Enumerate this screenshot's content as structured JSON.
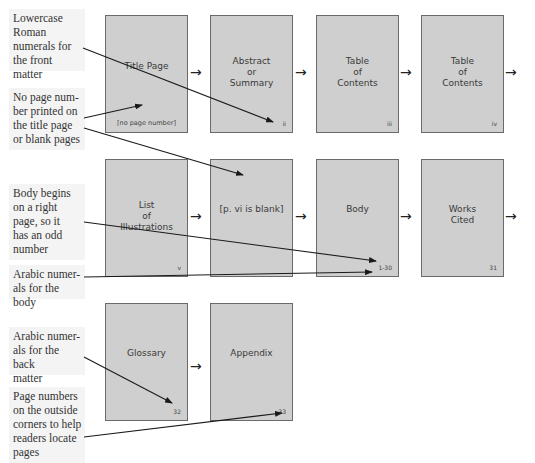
{
  "annotations": [
    {
      "id": "front-matter",
      "text": "Lowercase\nRoman\nnumerals for\nthe front matter"
    },
    {
      "id": "no-number",
      "text": "No page num-\nber printed on\nthe title page\nor blank pages"
    },
    {
      "id": "body-right",
      "text": "Body begins\non a right\npage, so it\nhas an odd\nnumber"
    },
    {
      "id": "arabic-body",
      "text": "Arabic numer-\nals for the body"
    },
    {
      "id": "arabic-back",
      "text": "Arabic numer-\nals for the back\nmatter"
    },
    {
      "id": "outside-corners",
      "text": "Page numbers\non the outside\ncorners to help\nreaders locate\npages"
    }
  ],
  "rows": [
    {
      "pages": [
        {
          "title": "Title Page",
          "number": "[no page number]"
        },
        {
          "title": "Abstract\nor\nSummary",
          "number": "ii"
        },
        {
          "title": "Table\nof\nContents",
          "number": "iii"
        },
        {
          "title": "Table\nof\nContents",
          "number": "iv"
        }
      ]
    },
    {
      "pages": [
        {
          "title": "List\nof\nIllustrations",
          "number": "v"
        },
        {
          "title": "[p. vi is blank]",
          "number": ""
        },
        {
          "title": "Body",
          "number": "1-30"
        },
        {
          "title": "Works\nCited",
          "number": "31"
        }
      ]
    },
    {
      "pages": [
        {
          "title": "Glossary",
          "number": "32"
        },
        {
          "title": "Appendix",
          "number": "33"
        }
      ]
    }
  ],
  "flow_arrow_glyph": "→",
  "colors": {
    "page_fill": "#cfcfcf",
    "page_border": "#6a6a6a",
    "note_bg": "#f4f4f4",
    "line": "#222222"
  }
}
